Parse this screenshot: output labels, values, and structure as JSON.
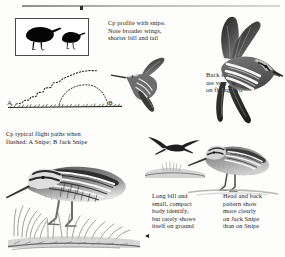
{
  "page": {
    "background_color": "#fdfdfc",
    "ink_color": "#1c1c1c"
  },
  "rule": {
    "name": "top-rule"
  },
  "silhouette_box": {
    "name": "comparative-silhouettes",
    "birds": [
      "snipe-silhouette",
      "jack-snipe-silhouette"
    ],
    "border_color": "#4a4a4a"
  },
  "captions": {
    "cp_profile": "Cp profile with snipe.\nNote broader wings,\nshorter bill and tail",
    "back_stripes": "Back stripes\nare very vivid\non flying bird",
    "flight_paths": "Cp typical flight paths when\nflushed: A Snipe; B Jack Snipe",
    "long_bill": "Long bill and\nsmall, compact\nbody identify,\nbut rarely shows\nitself on ground",
    "head_and_back": "Head and back\npattern show\nmore clearly\non Jack Snipe\nthan on Snipe"
  },
  "diagram": {
    "label_a": "A",
    "label_b": "B",
    "path_a_name": "snipe-zigzag-flight-path",
    "path_b_name": "jack-snipe-arc-flight-path",
    "ground_name": "ground-line"
  },
  "illustrations": {
    "flying_snipe_large": "flying-snipe-large",
    "flying_snipe_mid": "flying-snipe-mid",
    "flying_bird_small": "flying-bird-small-silhouette",
    "jack_snipe_ground": "jack-snipe-standing",
    "snipe_ground": "snipe-standing-in-grass"
  }
}
